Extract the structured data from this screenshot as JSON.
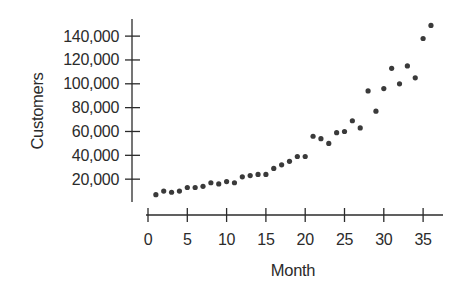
{
  "chart_data": {
    "type": "scatter",
    "title": "",
    "xlabel": "Month",
    "ylabel": "Customers",
    "xlim": [
      0,
      37
    ],
    "ylim": [
      0,
      150000
    ],
    "grid": false,
    "legend": null,
    "x_ticks": [
      0,
      5,
      10,
      15,
      20,
      25,
      30,
      35
    ],
    "x_tick_labels": [
      "0",
      "5",
      "10",
      "15",
      "20",
      "25",
      "30",
      "35"
    ],
    "y_ticks": [
      20000,
      40000,
      60000,
      80000,
      100000,
      120000,
      140000
    ],
    "y_tick_labels": [
      "20,000",
      "40,000",
      "60,000",
      "80,000",
      "100,000",
      "120,000",
      "140,000"
    ],
    "series": [
      {
        "name": "Customers",
        "color": "#3a3a3a",
        "x": [
          1,
          2,
          3,
          4,
          5,
          6,
          7,
          8,
          9,
          10,
          11,
          12,
          13,
          14,
          15,
          16,
          17,
          18,
          19,
          20,
          21,
          22,
          23,
          24,
          25,
          26,
          27,
          28,
          29,
          30,
          31,
          32,
          33,
          34,
          35,
          36
        ],
        "y": [
          7000,
          10000,
          9000,
          10000,
          13000,
          13000,
          14000,
          17000,
          16000,
          18000,
          17000,
          22000,
          23000,
          24000,
          24000,
          29000,
          32000,
          35000,
          39000,
          39000,
          56000,
          54000,
          50000,
          59000,
          60000,
          69000,
          63000,
          94000,
          77000,
          96000,
          113000,
          100000,
          115000,
          105000,
          138000,
          149000
        ]
      }
    ]
  },
  "axes": {
    "x_title": "Month",
    "y_title": "Customers"
  }
}
